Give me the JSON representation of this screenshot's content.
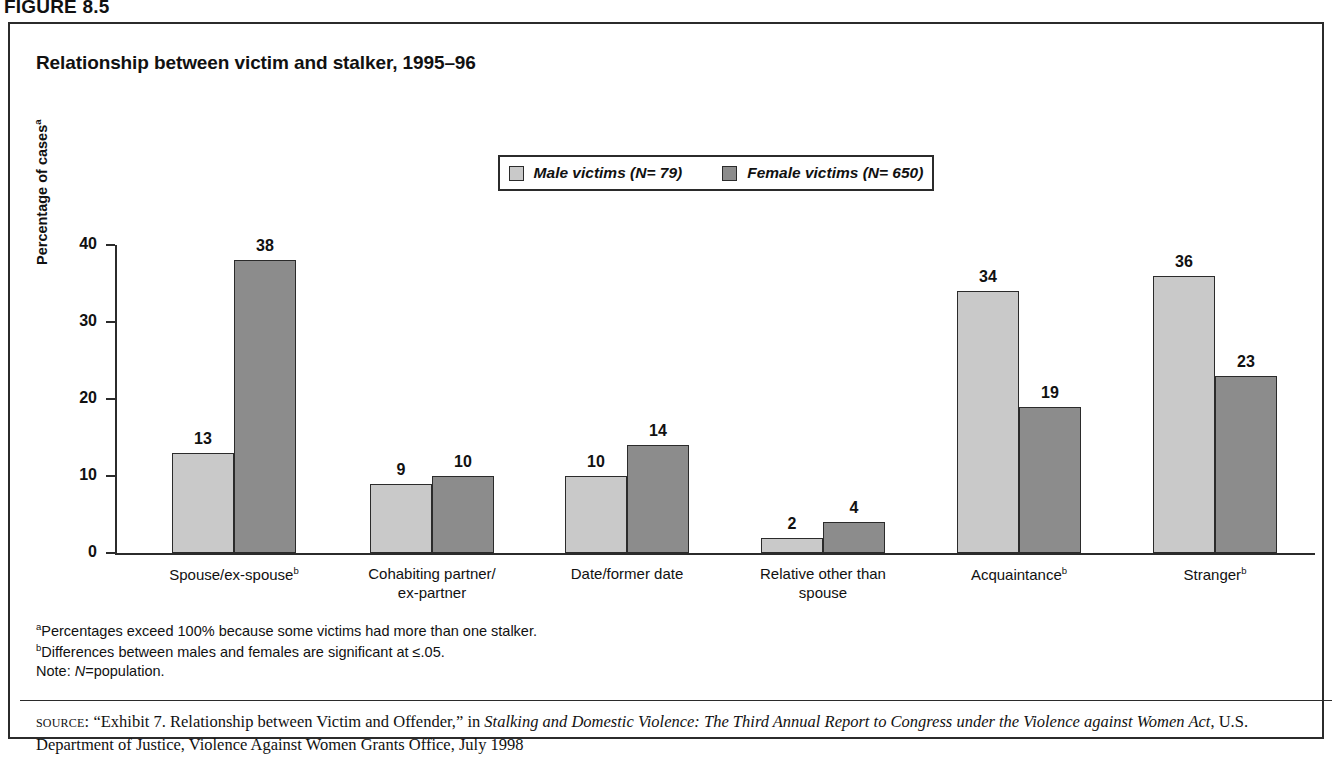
{
  "figure": {
    "label": "FIGURE 8.5"
  },
  "chart": {
    "title": "Relationship between victim and stalker, 1995–96",
    "y_axis_title": "Percentage of cases",
    "y_axis_title_footnote": "a",
    "legend": [
      {
        "label": "Male victims (N= 79)",
        "color": "#c9c9c9",
        "swatch_name": "male-victims-swatch"
      },
      {
        "label": "Female victims (N= 650)",
        "color": "#8c8c8c",
        "swatch_name": "female-victims-swatch"
      }
    ],
    "y_ticks": [
      "40",
      "30",
      "20",
      "10",
      "0"
    ]
  },
  "chart_data": {
    "type": "bar",
    "title": "Relationship between victim and stalker, 1995–96",
    "xlabel": "",
    "ylabel": "Percentage of cases",
    "ylim": [
      0,
      40
    ],
    "yticks": [
      0,
      10,
      20,
      30,
      40
    ],
    "grid": false,
    "legend_position": "top-center",
    "categories": [
      "Spouse/ex-spouseᵇ",
      "Cohabiting partner/\nex-partner",
      "Date/former date",
      "Relative other than\nspouse",
      "Acquaintanceᵇ",
      "Strangerᵇ"
    ],
    "category_labels": [
      {
        "text": "Spouse/ex-spouse",
        "footnote": "b",
        "line2": ""
      },
      {
        "text": "Cohabiting partner/",
        "footnote": "",
        "line2": "ex-partner"
      },
      {
        "text": "Date/former date",
        "footnote": "",
        "line2": ""
      },
      {
        "text": "Relative other than",
        "footnote": "",
        "line2": "spouse"
      },
      {
        "text": "Acquaintance",
        "footnote": "b",
        "line2": ""
      },
      {
        "text": "Stranger",
        "footnote": "b",
        "line2": ""
      }
    ],
    "series": [
      {
        "name": "Male victims (N= 79)",
        "color": "#c9c9c9",
        "values": [
          13,
          9,
          10,
          2,
          34,
          36
        ]
      },
      {
        "name": "Female victims (N= 650)",
        "color": "#8c8c8c",
        "values": [
          38,
          10,
          14,
          4,
          19,
          23
        ]
      }
    ]
  },
  "footnotes": {
    "a_marker": "a",
    "a_text": "Percentages exceed 100% because some victims had more than one stalker.",
    "b_marker": "b",
    "b_text": "Differences between males and females are significant at ≤.05.",
    "note_prefix": "Note: ",
    "note_italic": "N",
    "note_rest": "=population."
  },
  "source": {
    "label": "source:",
    "part1": " “Exhibit 7. Relationship between Victim and Offender,” in ",
    "italic1": "Stalking and Domestic Violence: The Third Annual Report to Congress under the Violence against Women Act",
    "part2": ", U.S. Department of Justice, Violence Against Women Grants Office, July 1998"
  }
}
